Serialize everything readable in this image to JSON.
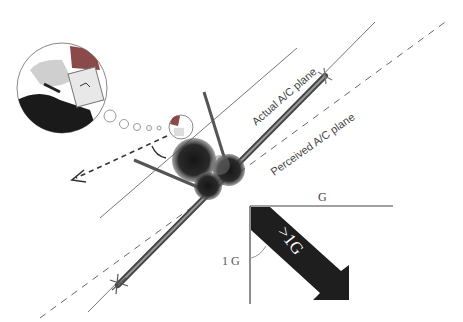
{
  "labels": {
    "actual_plane": "Actual A/C plane",
    "perceived_plane": "Perceived A/C plane",
    "g_top": "G",
    "one_g": "1 G",
    "greater_than_one_g": ">1G"
  },
  "colors": {
    "background": "#ffffff",
    "line": "#555555",
    "dark": "#1e1e1e",
    "helmet_visor": "#8a4a4a"
  }
}
